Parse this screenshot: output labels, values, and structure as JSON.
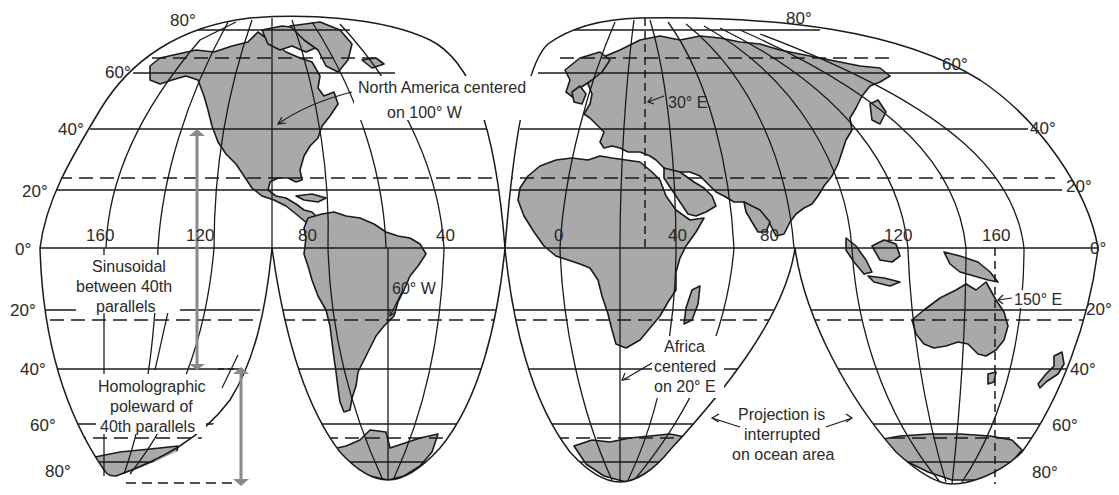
{
  "latitude_labels_left": {
    "n80": "80°",
    "n60": "60°",
    "n40": "40°",
    "n20": "20°",
    "eq": "0°",
    "s20": "20°",
    "s40": "40°",
    "s60": "60°",
    "s80": "80°"
  },
  "latitude_labels_right": {
    "n80": "80°",
    "n60": "60°",
    "n40": "40°",
    "n20": "20°",
    "eq": "0°",
    "s20": "20°",
    "s40": "40°",
    "s60": "60°",
    "s80": "80°"
  },
  "longitude_labels": {
    "w160": "160",
    "w120": "120",
    "w80": "80",
    "w40": "40",
    "e0": "0",
    "e40": "40",
    "e80": "80",
    "e120": "120",
    "e160": "160"
  },
  "annotations": {
    "north_america_line1": "North America centered",
    "north_america_line2": "on 100° W",
    "eurasia_meridian": "30° E.",
    "south_america_meridian": "60° W",
    "sinusoidal_line1": "Sinusoidal",
    "sinusoidal_line2": "between 40th",
    "sinusoidal_line3": "parallels",
    "homolographic_line1": "Homolographic",
    "homolographic_line2": "poleward of",
    "homolographic_line3": "40th parallels",
    "africa_line1": "Africa",
    "africa_line2": "centered",
    "africa_line3": "on 20° E",
    "interrupted_line1": "Projection is",
    "interrupted_line2": "interrupted",
    "interrupted_line3": "on ocean area",
    "australia_meridian": "150° E"
  },
  "colors": {
    "land": "#a9a9a9",
    "lines": "#1a1a1a",
    "range_arrows": "#8a8a8a",
    "background": "#ffffff"
  }
}
